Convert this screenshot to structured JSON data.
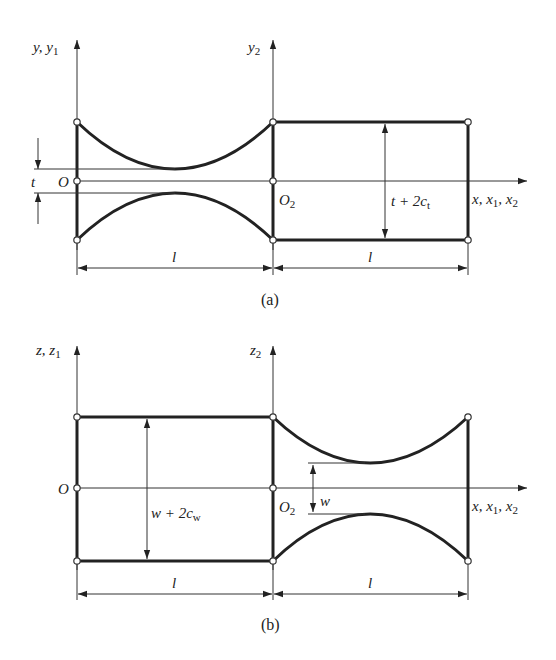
{
  "figure": {
    "panel_a": {
      "caption": "(a)",
      "axis_y_label": "y, y",
      "axis_y_sub": "1",
      "axis_y2_label": "y",
      "axis_y2_sub": "2",
      "origin_label": "O",
      "origin2_label": "O",
      "origin2_sub": "2",
      "x_axis_label": "x, x",
      "x_axis_sub1": "1",
      "x_axis_sep": ", x",
      "x_axis_sub2": "2",
      "thickness_label": "t",
      "rect_dim_label": "t + 2c",
      "rect_dim_sub": "t",
      "length_label_left": "l",
      "length_label_right": "l"
    },
    "panel_b": {
      "caption": "(b)",
      "axis_z_label": "z, z",
      "axis_z_sub": "1",
      "axis_z2_label": "z",
      "axis_z2_sub": "2",
      "origin_label": "O",
      "origin2_label": "O",
      "origin2_sub": "2",
      "x_axis_label": "x, x",
      "x_axis_sub1": "1",
      "x_axis_sep": ", x",
      "x_axis_sub2": "2",
      "width_label": "w",
      "rect_dim_label": "w + 2c",
      "rect_dim_sub": "w",
      "length_label_left": "l",
      "length_label_right": "l"
    }
  }
}
